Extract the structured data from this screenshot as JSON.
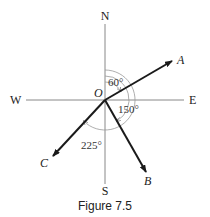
{
  "figure": {
    "caption": "Figure 7.5",
    "compass": {
      "north": "N",
      "south": "S",
      "east": "E",
      "west": "W"
    },
    "origin_label": "O",
    "vectors": [
      {
        "label": "A",
        "bearing_deg": 60
      },
      {
        "label": "B",
        "bearing_deg": 150
      },
      {
        "label": "C",
        "bearing_deg": 225
      }
    ],
    "angles": [
      {
        "text": "60°"
      },
      {
        "text": "150°"
      },
      {
        "text": "225°"
      }
    ],
    "colors": {
      "axis": "#888888",
      "vector": "#1a1a1a",
      "arc": "#999999"
    }
  }
}
